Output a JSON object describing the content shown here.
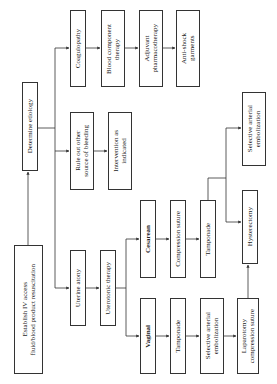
{
  "diagram": {
    "orientation": "rotated-90-ccw",
    "nodes": {
      "establish": "Establish IV access\nfluid/blood product resuscitation",
      "determine": "Determine etiology",
      "coagulopathy": "Coagulopathy",
      "blood_component": "Blood component\ntherapy",
      "adjuvant": "Adjuvant\npharmacotherapy",
      "anti_shock": "Anti-shock\ngarments",
      "rule_out": "Rule out other\nsource of bleeding",
      "intervention": "Intervention as\nindicated",
      "uterine_atony": "Uterine atony",
      "uterotonic": "Uterotonic therapy",
      "cesarean": "Cesarean",
      "compression_suture": "Compression suture",
      "tamponade_c": "Tamponade",
      "hysterectomy": "Hysterectomy",
      "selective_c": "Selective arterial\nembolization",
      "vaginal": "Vaginal",
      "tamponade_v": "Tamponade",
      "selective_v": "Selective arterial\nembolization",
      "laparotomy": "Laparotomy\ncompression suture"
    }
  }
}
